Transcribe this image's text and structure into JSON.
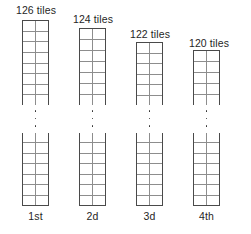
{
  "figure": {
    "type": "staircase-tile-columns",
    "canvas": {
      "width": 251,
      "height": 234
    },
    "colors": {
      "background": "#ffffff",
      "outer_stroke": "#4a4a4a",
      "inner_grid_stroke": "#8d8d8d",
      "text": "#1f1f1f",
      "dot": "#2a2a2a"
    },
    "cells_per_row": 2,
    "ellipsis_dot_count": 3
  },
  "columns": [
    {
      "tiles_label": "126 tiles",
      "ordinal_label": "1st",
      "tiles_count": 126,
      "left": 22,
      "width": 27,
      "top_section": {
        "y": 20,
        "height": 85,
        "rows": 8
      },
      "bottom_section": {
        "y": 133,
        "height": 73,
        "rows": 7
      },
      "label_left": -10,
      "label_top": 4,
      "label_width": 48,
      "ordinal_top": 210,
      "ellipsis_top": 110,
      "ellipsis_height": 17
    },
    {
      "tiles_label": "124 tiles",
      "ordinal_label": "2d",
      "tiles_count": 124,
      "left": 79,
      "width": 27,
      "top_section": {
        "y": 28,
        "height": 77,
        "rows": 7
      },
      "bottom_section": {
        "y": 133,
        "height": 73,
        "rows": 7
      },
      "label_left": -10,
      "label_top": 13,
      "label_width": 48,
      "ordinal_top": 210,
      "ellipsis_top": 110,
      "ellipsis_height": 17
    },
    {
      "tiles_label": "122 tiles",
      "ordinal_label": "3d",
      "tiles_count": 122,
      "left": 136,
      "width": 27,
      "top_section": {
        "y": 42,
        "height": 63,
        "rows": 6
      },
      "bottom_section": {
        "y": 133,
        "height": 73,
        "rows": 7
      },
      "label_left": -10,
      "label_top": 28,
      "label_width": 48,
      "ordinal_top": 210,
      "ellipsis_top": 110,
      "ellipsis_height": 17
    },
    {
      "tiles_label": "120 tiles",
      "ordinal_label": "4th",
      "tiles_count": 120,
      "left": 193,
      "width": 27,
      "top_section": {
        "y": 50,
        "height": 55,
        "rows": 5
      },
      "bottom_section": {
        "y": 133,
        "height": 73,
        "rows": 7
      },
      "label_left": -8,
      "label_top": 37,
      "label_width": 48,
      "ordinal_top": 210,
      "ellipsis_top": 110,
      "ellipsis_height": 17
    }
  ]
}
